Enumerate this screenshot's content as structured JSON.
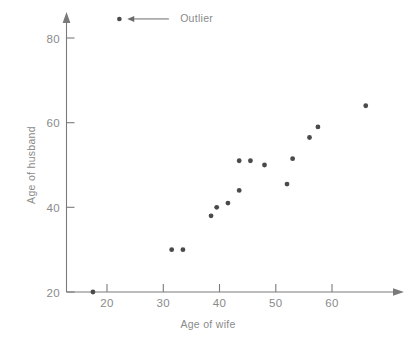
{
  "chart_data": {
    "type": "scatter",
    "title": "",
    "xlabel": "Age of wife",
    "ylabel": "Age of husband",
    "xlim": [
      13,
      70
    ],
    "ylim": [
      20,
      85
    ],
    "xticks": [
      20,
      30,
      40,
      50,
      60
    ],
    "xtick_labels": [
      "20",
      "30",
      "40",
      "50",
      "60"
    ],
    "yticks": [
      20,
      40,
      60,
      80
    ],
    "ytick_labels": [
      "20",
      "40",
      "60",
      "80"
    ],
    "grid": false,
    "legend_position": "top-left",
    "point_color": "#4a4a4a",
    "axis_color": "#7a7a7a",
    "text_color": "#8a8a8a",
    "series": [
      {
        "name": "Couples",
        "points": [
          {
            "x": 17.5,
            "y": 20,
            "outlier": true
          },
          {
            "x": 31.5,
            "y": 30,
            "outlier": false
          },
          {
            "x": 33.5,
            "y": 30,
            "outlier": false
          },
          {
            "x": 38.5,
            "y": 38,
            "outlier": false
          },
          {
            "x": 39.5,
            "y": 40,
            "outlier": false
          },
          {
            "x": 41.5,
            "y": 41,
            "outlier": false
          },
          {
            "x": 43.5,
            "y": 44,
            "outlier": false
          },
          {
            "x": 43.5,
            "y": 51,
            "outlier": false
          },
          {
            "x": 45.5,
            "y": 51,
            "outlier": false
          },
          {
            "x": 48.0,
            "y": 50,
            "outlier": false
          },
          {
            "x": 52.0,
            "y": 45.5,
            "outlier": false
          },
          {
            "x": 53.0,
            "y": 51.5,
            "outlier": false
          },
          {
            "x": 56.0,
            "y": 56.5,
            "outlier": false
          },
          {
            "x": 57.5,
            "y": 59,
            "outlier": false
          },
          {
            "x": 66.0,
            "y": 64,
            "outlier": false
          }
        ]
      }
    ],
    "annotations": [
      {
        "label": "Outlier",
        "marker_x": 22.2,
        "marker_y": 84.5,
        "arrow_from_x": 31.0,
        "arrow_to_x": 23.6,
        "arrow_y": 84.5,
        "text_x": 33.0
      }
    ]
  },
  "legend": {
    "outlier_label": "Outlier"
  },
  "axes": {
    "x_title": "Age of wife",
    "y_title": "Age of husband"
  }
}
